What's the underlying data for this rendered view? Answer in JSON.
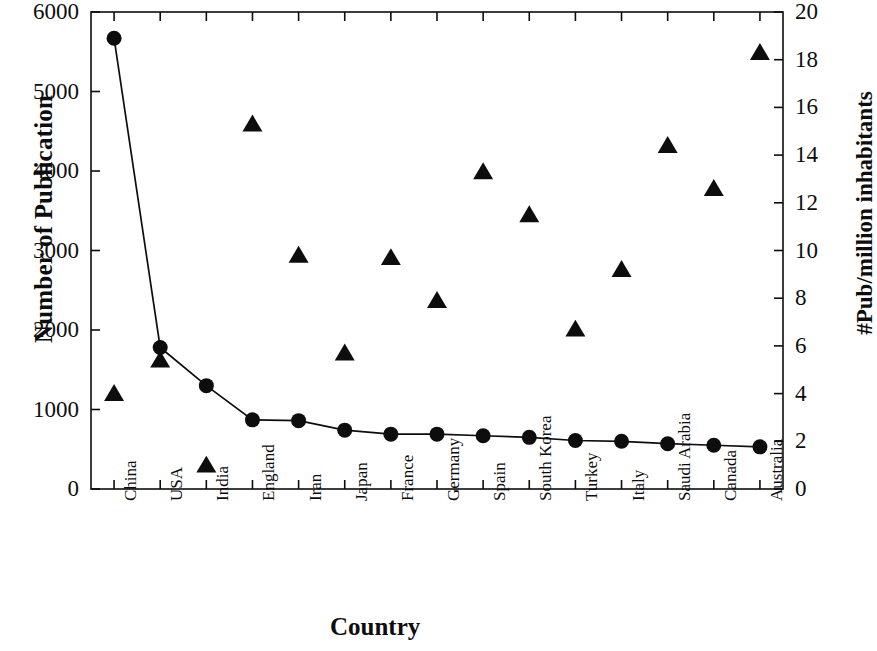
{
  "chart_data": {
    "type": "line",
    "title": "",
    "xlabel": "Country",
    "ylabel": "Number of Publication",
    "ylabel_right": "#Pub/million inhabitants",
    "ylim": [
      0,
      6000
    ],
    "ylim_right": [
      0,
      20
    ],
    "yticks": [
      0,
      1000,
      2000,
      3000,
      4000,
      5000,
      6000
    ],
    "yticks_right": [
      0,
      2,
      4,
      6,
      8,
      10,
      12,
      14,
      16,
      18,
      20
    ],
    "grid": false,
    "legend_position": "none",
    "categories": [
      "China",
      "USA",
      "India",
      "England",
      "Iran",
      "Japan",
      "France",
      "Germany",
      "Spain",
      "South Korea",
      "Turkey",
      "Italy",
      "Saudi Arabia",
      "Canada",
      "Australia"
    ],
    "series": [
      {
        "name": "Number of Publication",
        "axis": "left",
        "marker": "circle",
        "line": true,
        "color": "#0d0d0d",
        "values": [
          5670,
          1780,
          1300,
          870,
          860,
          740,
          690,
          690,
          670,
          650,
          610,
          600,
          570,
          550,
          530
        ]
      },
      {
        "name": "#Pub/million inhabitants",
        "axis": "right",
        "marker": "triangle",
        "line": false,
        "color": "#0d0d0d",
        "values": [
          4.0,
          5.4,
          1.0,
          15.3,
          9.8,
          5.7,
          9.7,
          7.9,
          13.3,
          11.5,
          6.7,
          9.2,
          14.4,
          12.6,
          18.3
        ]
      }
    ]
  },
  "axes": {
    "x_label": "Country",
    "y_left_label": "Number of Publication",
    "y_right_label": "#Pub/million inhabitants"
  }
}
